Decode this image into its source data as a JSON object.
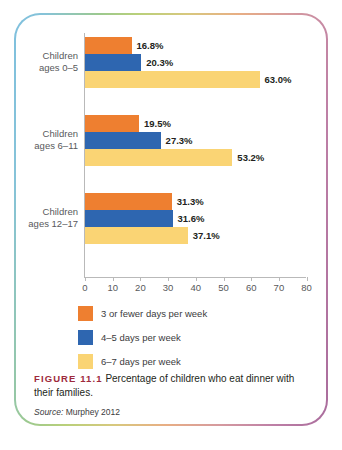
{
  "figure": {
    "tag": "FIGURE 11.1",
    "caption": "Percentage of children who eat dinner with their families.",
    "source_label": "Source:",
    "source_value": "Murphey 2012"
  },
  "colors": {
    "series_0": "#ee7f30",
    "series_1": "#2e66b0",
    "series_2": "#fad474",
    "caption_tag": "#9e2a3c",
    "axis": "#b9b9b9",
    "background": "#ffffff"
  },
  "chart_data": {
    "type": "bar",
    "orientation": "horizontal",
    "title": "",
    "xlabel": "",
    "ylabel": "",
    "xlim": [
      0,
      80
    ],
    "grid": false,
    "legend_position": "bottom-left",
    "categories": [
      "Children ages 0–5",
      "Children ages 6–11",
      "Children ages 12–17"
    ],
    "category_lines": [
      [
        "Children",
        "ages 0–5"
      ],
      [
        "Children",
        "ages 6–11"
      ],
      [
        "Children",
        "ages 12–17"
      ]
    ],
    "tick_values": [
      0,
      10,
      20,
      30,
      40,
      50,
      60,
      70,
      80
    ],
    "tick_labels": [
      "0",
      "10",
      "20",
      "30",
      "40",
      "50",
      "60",
      "70",
      "80"
    ],
    "series": [
      {
        "name": "3 or fewer days per week",
        "color": "#ee7f30",
        "values": [
          16.8,
          19.5,
          31.3
        ],
        "labels": [
          "16.8%",
          "19.5%",
          "31.3%"
        ]
      },
      {
        "name": "4–5 days per week",
        "color": "#2e66b0",
        "values": [
          20.3,
          27.3,
          31.6
        ],
        "labels": [
          "20.3%",
          "27.3%",
          "31.6%"
        ]
      },
      {
        "name": "6–7 days per week",
        "color": "#fad474",
        "values": [
          63.0,
          53.2,
          37.1
        ],
        "labels": [
          "63.0%",
          "53.2%",
          "37.1%"
        ]
      }
    ]
  }
}
